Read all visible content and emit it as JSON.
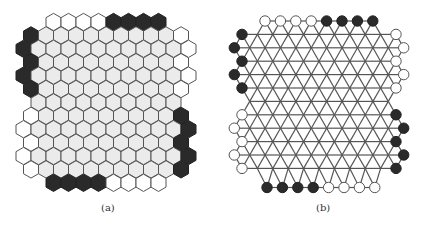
{
  "figure": {
    "panels": [
      {
        "id": "a",
        "caption": "(a)",
        "type": "hex-board",
        "colors": {
          "dark": "#2a2a2a",
          "white": "#ffffff",
          "gray": "#ebebeb",
          "stroke": "#555555"
        },
        "rows": [
          {
            "y": 22,
            "x0": 53.5,
            "cells": "WWWWDDDD"
          },
          {
            "y": 35.4,
            "x0": 31,
            "cells": "DGGGGGGGGGW"
          },
          {
            "y": 48.8,
            "x0": 23.5,
            "cells": "DGGGGGGGGGGW"
          },
          {
            "y": 62.2,
            "x0": 31,
            "cells": "DGGGGGGGGGW"
          },
          {
            "y": 75.6,
            "x0": 23.5,
            "cells": "DGGGGGGGGGGW"
          },
          {
            "y": 89,
            "x0": 31,
            "cells": "DGGGGGGGGGW"
          },
          {
            "y": 102.4,
            "x0": 38.5,
            "cells": "GGGGGGGGGG"
          },
          {
            "y": 115.8,
            "x0": 31,
            "cells": "WGGGGGGGGGD"
          },
          {
            "y": 129.2,
            "x0": 23.5,
            "cells": "WGGGGGGGGGGD"
          },
          {
            "y": 142.6,
            "x0": 31,
            "cells": "WGGGGGGGGGD"
          },
          {
            "y": 156,
            "x0": 23.5,
            "cells": "WGGGGGGGGGGD"
          },
          {
            "y": 169.4,
            "x0": 31,
            "cells": "WGGGGGGGGGD"
          },
          {
            "y": 182.8,
            "x0": 53.5,
            "cells": "DDDDWWWW"
          }
        ],
        "pitch": 15,
        "caption_pos": [
          101,
          212
        ]
      },
      {
        "id": "b",
        "caption": "(b)",
        "type": "lattice-graph",
        "colors": {
          "dark": "#2a2a2a",
          "white": "#ffffff",
          "line": "#555555"
        },
        "rows": [
          {
            "y": 21,
            "x0": 265,
            "cells": "WWWWDDDD"
          },
          {
            "y": 34.4,
            "x0": 242,
            "cells": "DGGGGGGGGGW"
          },
          {
            "y": 47.8,
            "x0": 234.3,
            "cells": "DGGGGGGGGGGW"
          },
          {
            "y": 61.2,
            "x0": 242,
            "cells": "DGGGGGGGGGW"
          },
          {
            "y": 74.6,
            "x0": 234.3,
            "cells": "DGGGGGGGGGGW"
          },
          {
            "y": 88,
            "x0": 242,
            "cells": "DGGGGGGGGGW"
          },
          {
            "y": 101.4,
            "x0": 249.7,
            "cells": "GGGGGGGGGG"
          },
          {
            "y": 114.8,
            "x0": 242,
            "cells": "WGGGGGGGGGD"
          },
          {
            "y": 128.2,
            "x0": 234.3,
            "cells": "WGGGGGGGGGGD"
          },
          {
            "y": 141.6,
            "x0": 242,
            "cells": "WGGGGGGGGGD"
          },
          {
            "y": 155,
            "x0": 234.3,
            "cells": "WGGGGGGGGGGD"
          },
          {
            "y": 168.4,
            "x0": 242,
            "cells": "WGGGGGGGGGD"
          },
          {
            "y": 187.5,
            "x0": 267,
            "cells": "DDDDWWWW"
          }
        ],
        "pitch": 15.4,
        "node_radius": 5.2,
        "caption_pos": [
          316,
          212
        ]
      }
    ]
  }
}
